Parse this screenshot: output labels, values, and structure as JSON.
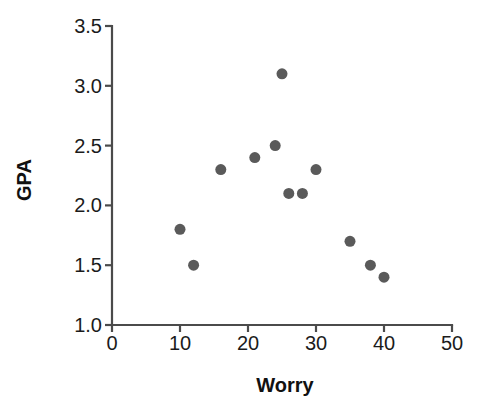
{
  "chart_data": {
    "type": "scatter",
    "title": "",
    "xlabel": "Worry",
    "ylabel": "GPA",
    "xlim": [
      0,
      50
    ],
    "ylim": [
      1.0,
      3.5
    ],
    "xticks": [
      "0",
      "10",
      "20",
      "30",
      "40",
      "50"
    ],
    "xtick_values": [
      0,
      10,
      20,
      30,
      40,
      50
    ],
    "yticks": [
      "1.0",
      "1.5",
      "2.0",
      "2.5",
      "3.0",
      "3.5"
    ],
    "ytick_values": [
      1.0,
      1.5,
      2.0,
      2.5,
      3.0,
      3.5
    ],
    "grid": false,
    "legend": false,
    "marker_color": "#5a5a5a",
    "marker_size": 11,
    "axis_color": "#4b4b4b",
    "background": "#ffffff",
    "points": [
      {
        "x": 10,
        "y": 1.8
      },
      {
        "x": 12,
        "y": 1.5
      },
      {
        "x": 16,
        "y": 2.3
      },
      {
        "x": 21,
        "y": 2.4
      },
      {
        "x": 24,
        "y": 2.5
      },
      {
        "x": 25,
        "y": 3.1
      },
      {
        "x": 26,
        "y": 2.1
      },
      {
        "x": 28,
        "y": 2.1
      },
      {
        "x": 30,
        "y": 2.3
      },
      {
        "x": 35,
        "y": 1.7
      },
      {
        "x": 38,
        "y": 1.5
      },
      {
        "x": 40,
        "y": 1.4
      }
    ]
  },
  "geometry": {
    "plot_left": 112,
    "plot_right": 452,
    "plot_top": 26,
    "plot_bottom": 325,
    "tick_len": 7,
    "xtick_label_y": 350,
    "ytick_label_x": 102,
    "xlabel_x": 285,
    "xlabel_y": 392,
    "ylabel_x": 31,
    "ylabel_y": 180
  }
}
